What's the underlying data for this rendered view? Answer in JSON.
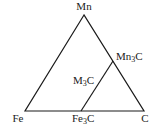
{
  "diagram": {
    "type": "ternary-phase-triangle",
    "vertices": {
      "top": "Mn",
      "bottom_left": "Fe",
      "bottom_right": "C"
    },
    "points": {
      "fe3c": {
        "base": "Fe",
        "sub": "3",
        "tail": "C"
      },
      "mn3c": {
        "base": "Mn",
        "sub": "3",
        "tail": "C"
      }
    },
    "tie_line_label": {
      "base": "M",
      "sub": "3",
      "tail": "C"
    },
    "line_color": "#1a1a1a"
  }
}
